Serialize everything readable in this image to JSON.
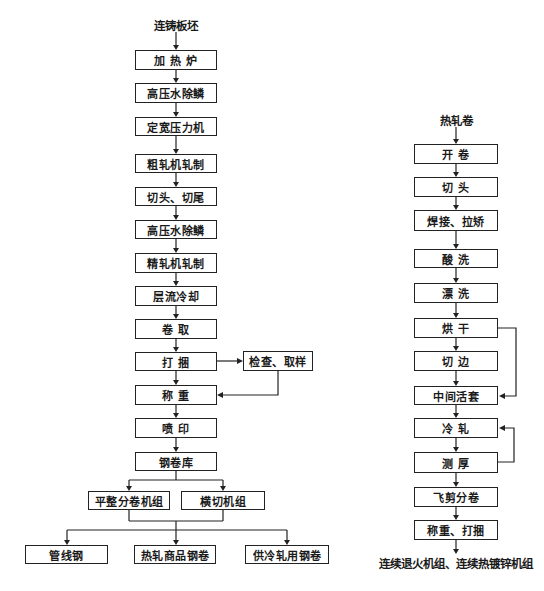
{
  "left_flow": {
    "start": "连铸板坯",
    "steps": [
      "加 热 炉",
      "高压水除鳞",
      "定宽压力机",
      "粗轧机轧制",
      "切头、切尾",
      "高压水除鳞",
      "精轧机轧制",
      "层流冷却",
      "卷 取",
      "打 捆",
      "称 重",
      "喷 印",
      "钢卷库"
    ],
    "side_step": "检查、取样",
    "branches": [
      "平整分卷机组",
      "横切机组"
    ],
    "products": [
      "管线钢",
      "热轧商品钢卷",
      "供冷轧用钢卷"
    ]
  },
  "right_flow": {
    "start": "热轧卷",
    "steps": [
      "开 卷",
      "切 头",
      "焊接、拉矫",
      "酸 洗",
      "漂 洗",
      "烘 干",
      "切 边",
      "中间活套",
      "冷 轧",
      "测 厚",
      "飞剪分卷",
      "称重、打捆"
    ],
    "end": "连续退火机组、连续热镀锌机组"
  }
}
